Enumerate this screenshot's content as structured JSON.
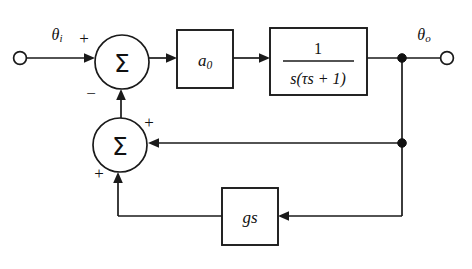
{
  "diagram": {
    "background_color": "#ffffff",
    "line_color": "#1a1a1a",
    "input": {
      "terminal_name": "input-terminal",
      "label": "θ",
      "label_subscript": "i",
      "sign": "+"
    },
    "output": {
      "terminal_name": "output-terminal",
      "label": "θ",
      "label_subscript": "o"
    },
    "summers": [
      {
        "id": "summer-top",
        "glyph": "Σ",
        "input_signs": [
          "+",
          "−"
        ],
        "forward_sign": "+",
        "feedback_sign": "−"
      },
      {
        "id": "summer-lower",
        "glyph": "Σ",
        "input_signs": [
          "+",
          "+"
        ],
        "right_sign": "+",
        "bottom_sign": "+"
      }
    ],
    "blocks": [
      {
        "id": "gain-block",
        "label": "a",
        "label_subscript": "0",
        "type": "gain"
      },
      {
        "id": "plant-block",
        "numerator": "1",
        "denominator_prefix": "s",
        "denominator_body": "(τs + 1)",
        "denominator": "s(τs + 1)",
        "type": "transfer-function"
      },
      {
        "id": "feedback-block",
        "label": "gs",
        "type": "feedback-gain"
      }
    ]
  }
}
